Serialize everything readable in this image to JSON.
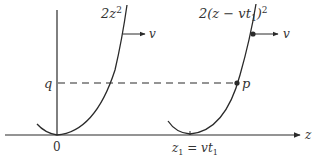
{
  "diagram": {
    "curve1_label": "2z",
    "curve1_exp": "2",
    "curve2_label": "2(z − vt",
    "curve2_sub": "1",
    "curve2_close": ")",
    "curve2_exp": "2",
    "velocity_label_1": "v",
    "velocity_label_2": "v",
    "point_q": "q",
    "point_p": "p",
    "origin_label": "0",
    "axis_label": "z",
    "z1_label_a": "z",
    "z1_sub_a": "1",
    "z1_label_eq": " = vt",
    "z1_sub_b": "1"
  },
  "colors": {
    "line": "#2a2a2a",
    "text": "#333333"
  }
}
